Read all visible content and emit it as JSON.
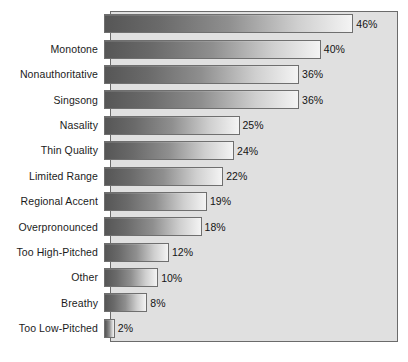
{
  "chart_data": {
    "type": "bar",
    "orientation": "horizontal",
    "title": "",
    "subtitle": "",
    "xlabel": "",
    "ylabel": "",
    "xlim": [
      0,
      50
    ],
    "grid": false,
    "legend": null,
    "value_suffix": "%",
    "categories": [
      "",
      "Monotone",
      "Nonauthoritative",
      "Singsong",
      "Nasality",
      "Thin Quality",
      "Limited Range",
      "Regional Accent",
      "Overpronounced",
      "Too High-Pitched",
      "Other",
      "Breathy",
      "Too Low-Pitched"
    ],
    "values": [
      46,
      40,
      36,
      36,
      25,
      24,
      22,
      19,
      18,
      12,
      10,
      8,
      2
    ],
    "value_labels": [
      "46%",
      "40%",
      "36%",
      "36%",
      "25%",
      "24%",
      "22%",
      "19%",
      "18%",
      "12%",
      "10%",
      "8%",
      "2%"
    ],
    "colors": {
      "bar_gradient_start": "#565656",
      "bar_gradient_end": "#f4f4f4",
      "bar_border": "#6f6f6f",
      "plot_background": "#e0e0e0",
      "plot_border": "#6b6b6b",
      "page_background": "#ffffff",
      "label_text": "#1b1b1b",
      "value_text": "#141414"
    }
  }
}
